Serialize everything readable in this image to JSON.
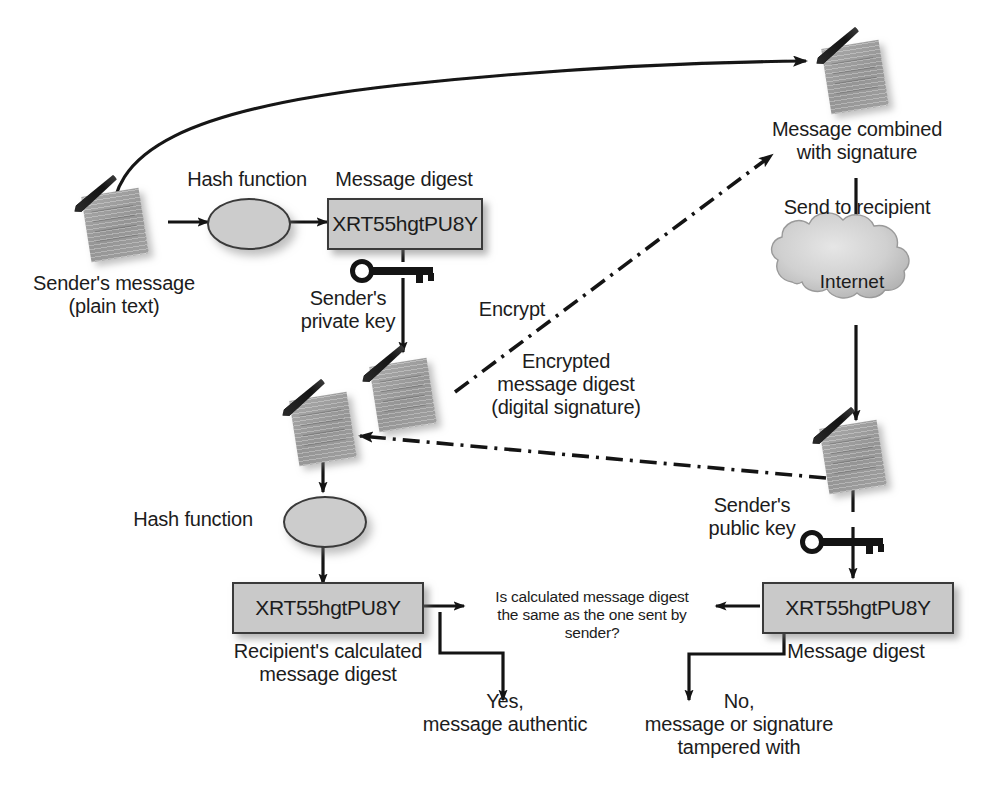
{
  "diagram": {
    "colors": {
      "box_fill": "#c9c9c9",
      "box_stroke": "#3a3a3a",
      "doc_fill": "#a8a8a8",
      "line": "#1a1a1a",
      "cloud_fill": "#d2d2d2",
      "text": "#1c1c1c"
    },
    "digest_value": "XRT55hgtPU8Y",
    "nodes": {
      "senders_message": "Sender's message\n(plain text)",
      "hash_function_top": "Hash function",
      "message_digest_top": "Message digest",
      "senders_private_key": "Sender's\nprivate key",
      "encrypt": "Encrypt",
      "encrypted_message_digest": "Encrypted\nmessage digest\n(digital signature)",
      "message_combined": "Message combined\nwith signature",
      "send_to_recipient": "Send to recipient",
      "internet": "Internet",
      "senders_public_key": "Sender's\npublic key",
      "message_digest_bottom": "Message digest",
      "hash_function_bottom": "Hash function",
      "recipients_calculated": "Recipient's calculated\nmessage digest",
      "decision": "Is calculated message digest\nthe same as the one sent by\nsender?",
      "yes_branch": "Yes,\nmessage authentic",
      "no_branch": "No,\nmessage or signature\ntampered with"
    },
    "digest_boxes": [
      {
        "id": "top",
        "value": "XRT55hgtPU8Y"
      },
      {
        "id": "recipient-calculated",
        "value": "XRT55hgtPU8Y"
      },
      {
        "id": "decrypted",
        "value": "XRT55hgtPU8Y"
      }
    ]
  }
}
